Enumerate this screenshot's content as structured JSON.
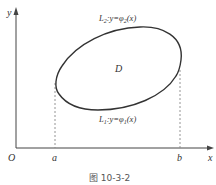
{
  "figure": {
    "caption": "图 10-3-2",
    "axes": {
      "x_label": "x",
      "y_label": "y",
      "origin_label": "O"
    },
    "ticks": {
      "a_label": "a",
      "b_label": "b"
    },
    "region_label": "D",
    "upper_curve": {
      "name": "L",
      "subscript": "2",
      "equation_prefix": ":y=φ",
      "equation_sub": "2",
      "equation_suffix": "(x)"
    },
    "lower_curve": {
      "name": "L",
      "subscript": "1",
      "equation_prefix": ":y=φ",
      "equation_sub": "1",
      "equation_suffix": "(x)"
    },
    "colors": {
      "curve": "#333333",
      "axis": "#444444",
      "dashed": "#888888"
    }
  }
}
